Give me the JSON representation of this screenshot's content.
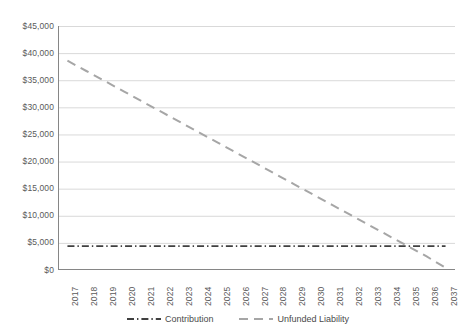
{
  "chart_data": {
    "type": "line",
    "title": "",
    "xlabel": "",
    "ylabel": "",
    "ylim": [
      0,
      45000
    ],
    "y_tick_step": 5000,
    "grid": true,
    "legend_position": "bottom",
    "y_ticks": [
      "$0",
      "$5,000",
      "$10,000",
      "$15,000",
      "$20,000",
      "$25,000",
      "$30,000",
      "$35,000",
      "$40,000",
      "$45,000"
    ],
    "categories": [
      "2017",
      "2018",
      "2019",
      "2020",
      "2021",
      "2022",
      "2023",
      "2024",
      "2025",
      "2026",
      "2027",
      "2028",
      "2029",
      "2030",
      "2031",
      "2032",
      "2033",
      "2034",
      "2035",
      "2036",
      "2037"
    ],
    "series": [
      {
        "name": "Contribution",
        "color": "#404040",
        "dash": "dash-dot",
        "values": [
          4400,
          4400,
          4400,
          4400,
          4400,
          4400,
          4400,
          4400,
          4400,
          4400,
          4400,
          4400,
          4400,
          4400,
          4400,
          4400,
          4400,
          4400,
          4400,
          4400,
          4400
        ]
      },
      {
        "name": "Unfunded Liability",
        "color": "#a6a6a6",
        "dash": "dashed",
        "values": [
          38600,
          36700,
          34800,
          32900,
          31000,
          29100,
          27200,
          25300,
          23400,
          21500,
          19600,
          17700,
          15800,
          13900,
          12000,
          10100,
          8200,
          6300,
          4400,
          2500,
          400
        ]
      }
    ]
  },
  "legend": {
    "items": [
      {
        "label": "Contribution",
        "icon": "dash-dot-line-swatch"
      },
      {
        "label": "Unfunded Liability",
        "icon": "dashed-line-swatch"
      }
    ]
  },
  "colors": {
    "contribution": "#404040",
    "unfunded_liability": "#a6a6a6",
    "gridline": "#d9d9d9",
    "axis": "#868686",
    "text": "#5a5a5a"
  }
}
